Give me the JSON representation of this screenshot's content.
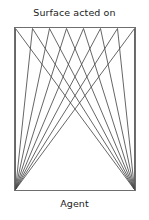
{
  "figure": {
    "title_top": "Surface acted on",
    "title_bottom": "Agent",
    "background_color": "#ffffff",
    "line_color": "#4a4a4a",
    "frame_color": "#6e6e6e",
    "text_color": "#1b1b1b"
  },
  "chart_data": {
    "type": "diagram",
    "title": "Surface acted on",
    "subtitle": "Agent",
    "frame": {
      "x_left": 14,
      "x_right": 135,
      "y_top": 27,
      "y_bottom": 190,
      "stroke_width": 1
    },
    "sources": [
      {
        "name": "agent-left",
        "x": 15,
        "y": 189
      },
      {
        "name": "agent-right",
        "x": 134,
        "y": 189
      }
    ],
    "surface_nodes": [
      {
        "index": 0,
        "x": 15,
        "y": 28
      },
      {
        "index": 1,
        "x": 32,
        "y": 28
      },
      {
        "index": 2,
        "x": 49,
        "y": 28
      },
      {
        "index": 3,
        "x": 66,
        "y": 28
      },
      {
        "index": 4,
        "x": 83,
        "y": 28
      },
      {
        "index": 5,
        "x": 100,
        "y": 28
      },
      {
        "index": 6,
        "x": 117,
        "y": 28
      },
      {
        "index": 7,
        "x": 134,
        "y": 28
      }
    ],
    "rays_from_left": [
      {
        "from": "agent-left",
        "to_node": 0
      },
      {
        "from": "agent-left",
        "to_node": 1
      },
      {
        "from": "agent-left",
        "to_node": 2
      },
      {
        "from": "agent-left",
        "to_node": 3
      },
      {
        "from": "agent-left",
        "to_node": 4
      },
      {
        "from": "agent-left",
        "to_node": 5
      },
      {
        "from": "agent-left",
        "to_node": 6
      },
      {
        "from": "agent-left",
        "to_node": 7
      }
    ],
    "rays_from_right": [
      {
        "from": "agent-right",
        "to_node": 0
      },
      {
        "from": "agent-right",
        "to_node": 1
      },
      {
        "from": "agent-right",
        "to_node": 2
      },
      {
        "from": "agent-right",
        "to_node": 3
      },
      {
        "from": "agent-right",
        "to_node": 4
      },
      {
        "from": "agent-right",
        "to_node": 5
      },
      {
        "from": "agent-right",
        "to_node": 6
      },
      {
        "from": "agent-right",
        "to_node": 7
      }
    ],
    "ray_count_total": 16,
    "node_count": 8,
    "grid": false,
    "legend": false
  }
}
